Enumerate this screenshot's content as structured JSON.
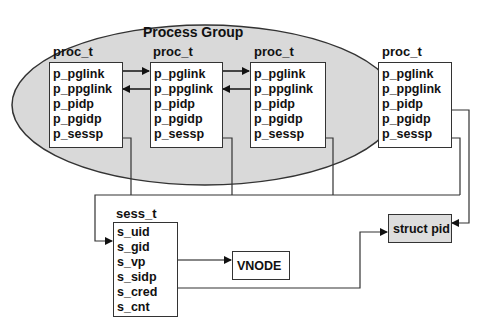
{
  "diagram": {
    "group": {
      "title": "Process Group",
      "fill": "#d9d9d9"
    },
    "proc_structs": [
      {
        "type_label": "proc_t",
        "fields": [
          "p_pglink",
          "p_ppglink",
          "p_pidp",
          "p_pgidp",
          "p_sessp"
        ]
      },
      {
        "type_label": "proc_t",
        "fields": [
          "p_pglink",
          "p_ppglink",
          "p_pidp",
          "p_pgidp",
          "p_sessp"
        ]
      },
      {
        "type_label": "proc_t",
        "fields": [
          "p_pglink",
          "p_ppglink",
          "p_pidp",
          "p_pgidp",
          "p_sessp"
        ]
      },
      {
        "type_label": "proc_t",
        "fields": [
          "p_pglink",
          "p_ppglink",
          "p_pidp",
          "p_pgidp",
          "p_sessp"
        ]
      }
    ],
    "session": {
      "type_label": "sess_t",
      "fields": [
        "s_uid",
        "s_gid",
        "s_vp",
        "s_sidp",
        "s_cred",
        "s_cnt"
      ]
    },
    "vnode": {
      "label": "VNODE"
    },
    "struct_pid": {
      "label": "struct pid",
      "fill": "#dddddd"
    }
  }
}
